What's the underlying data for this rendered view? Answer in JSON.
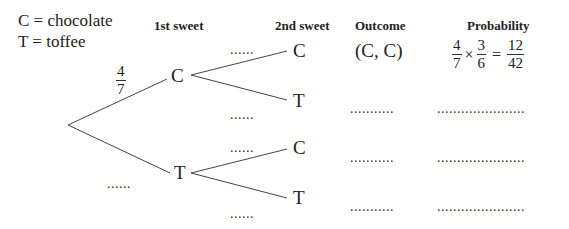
{
  "legend": {
    "line1": "C = chocolate",
    "line2": "T = toffee"
  },
  "headers": {
    "first": "1st sweet",
    "second": "2nd sweet",
    "outcome": "Outcome",
    "probability": "Probability"
  },
  "first_branch": {
    "upper_prob_num": "4",
    "upper_prob_den": "7",
    "upper_node": "C",
    "lower_prob": "......",
    "lower_node": "T"
  },
  "second_branch": {
    "cc_prob": "......",
    "cc_node": "C",
    "ct_prob": "......",
    "ct_node": "T",
    "tc_prob": "......",
    "tc_node": "C",
    "tt_prob": "......",
    "tt_node": "T"
  },
  "outcomes": {
    "row1": "(C, C)",
    "row2": "...........",
    "row3": "...........",
    "row4": "..........."
  },
  "probabilities": {
    "row1": {
      "a_num": "4",
      "a_den": "7",
      "times": "×",
      "b_num": "3",
      "b_den": "6",
      "equals": "=",
      "r_num": "12",
      "r_den": "42"
    },
    "row2": "......................",
    "row3": "......................",
    "row4": "......................"
  }
}
